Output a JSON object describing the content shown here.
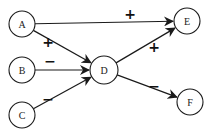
{
  "diagram": {
    "nodes": [
      {
        "id": "A",
        "label": "A"
      },
      {
        "id": "B",
        "label": "B"
      },
      {
        "id": "C",
        "label": "C"
      },
      {
        "id": "D",
        "label": "D"
      },
      {
        "id": "E",
        "label": "E"
      },
      {
        "id": "F",
        "label": "F"
      }
    ],
    "edges": [
      {
        "from": "A",
        "to": "E",
        "sign": "+"
      },
      {
        "from": "A",
        "to": "D",
        "sign": "+"
      },
      {
        "from": "B",
        "to": "D",
        "sign": "−"
      },
      {
        "from": "C",
        "to": "D",
        "sign": "−"
      },
      {
        "from": "D",
        "to": "E",
        "sign": "+"
      },
      {
        "from": "D",
        "to": "F",
        "sign": "−"
      }
    ]
  }
}
